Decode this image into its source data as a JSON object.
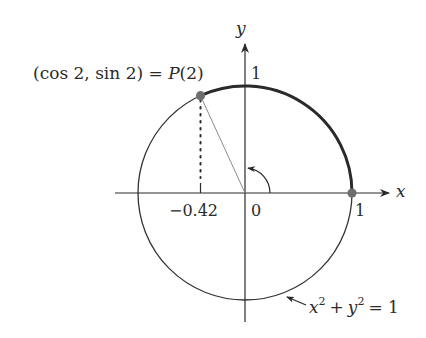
{
  "diagram": {
    "type": "unit-circle",
    "point_label": "(cos 2, sin 2) = P(2)",
    "point_label_parts": {
      "left": "(cos 2, sin 2) = ",
      "func": "P",
      "arg": "(2)"
    },
    "axes": {
      "x_label": "x",
      "y_label": "y"
    },
    "ticks": {
      "x_one": "1",
      "y_one": "1",
      "origin": "0",
      "cos_value": "−0.42"
    },
    "equation": {
      "x": "x",
      "y": "y",
      "exp": "2",
      "plus": "+",
      "equals": "= 1"
    },
    "angle_radians": 2,
    "colors": {
      "circle": "#333333",
      "arc": "#2a2a2a",
      "point": "#6e6e6e",
      "radius_line": "#8a8a8a",
      "axis": "#2a2a2a"
    }
  }
}
